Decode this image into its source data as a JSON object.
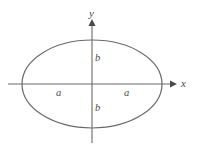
{
  "figure": {
    "type": "ellipse-with-axes-diagram",
    "background_color": "#ffffff",
    "stroke_color": "#6a6a6a",
    "label_color": "#4a4a4a",
    "axes": {
      "x_axis_label": "x",
      "y_axis_label": "y",
      "x_axis": {
        "start_x": 8,
        "end_x": 174,
        "y": 84,
        "arrow": "right"
      },
      "y_axis": {
        "x": 92,
        "start_y": 143,
        "end_y": 22,
        "arrow": "up"
      }
    },
    "ellipse": {
      "center_x": 92,
      "center_y": 84,
      "semi_major_axis_px": 70,
      "semi_minor_axis_px": 44
    },
    "labels": {
      "semi_major_left": "a",
      "semi_major_right": "a",
      "semi_minor_upper": "b",
      "semi_minor_lower": "b"
    }
  }
}
